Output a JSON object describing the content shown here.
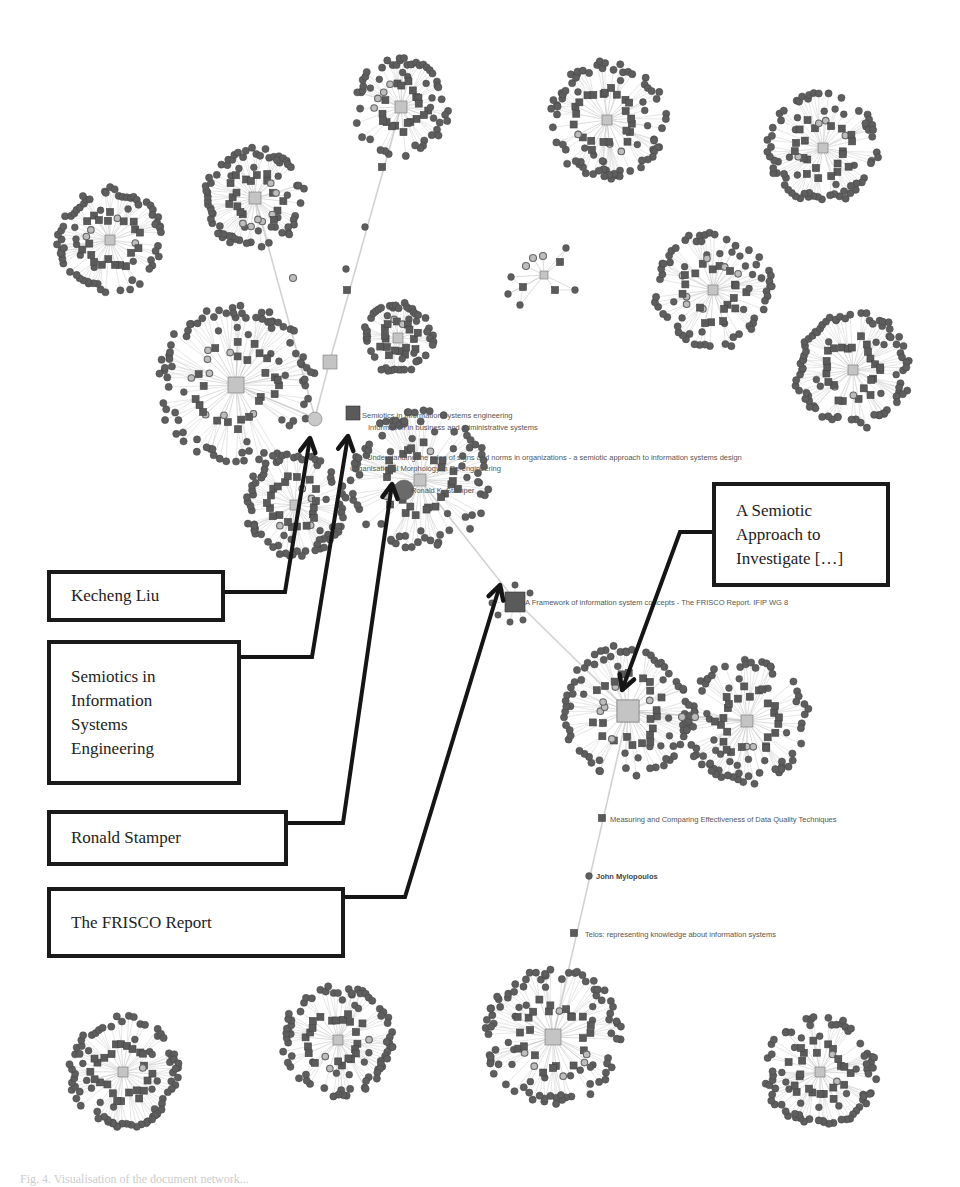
{
  "figure": {
    "type": "network-graph",
    "background": "#ffffff",
    "colors": {
      "document_node": "#5a5a5a",
      "author_node": "#5e5e5e",
      "hub_node": "#c4c4c4",
      "hub_border": "#777777",
      "edge": "#c8c8c8",
      "callout_border": "#1a1a1a",
      "arrow": "#151515"
    }
  },
  "callouts": [
    {
      "id": "kecheng-liu",
      "lines": [
        "Kecheng Liu"
      ],
      "box": [
        47,
        570,
        178,
        52
      ],
      "anchor": [
        225,
        592
      ],
      "path": [
        [
          225,
          592
        ],
        [
          285,
          592
        ],
        [
          310,
          438
        ]
      ]
    },
    {
      "id": "semiotics-ise",
      "lines": [
        "Semiotics in",
        "Information",
        "Systems",
        "Engineering"
      ],
      "box": [
        47,
        640,
        194,
        145
      ],
      "anchor": [
        241,
        657
      ],
      "path": [
        [
          241,
          657
        ],
        [
          312,
          657
        ],
        [
          348,
          436
        ]
      ]
    },
    {
      "id": "ronald-stamper",
      "lines": [
        "Ronald Stamper"
      ],
      "box": [
        47,
        810,
        241,
        56
      ],
      "anchor": [
        288,
        823
      ],
      "path": [
        [
          288,
          823
        ],
        [
          343,
          823
        ],
        [
          392,
          484
        ]
      ]
    },
    {
      "id": "frisco-report",
      "lines": [
        "The FRISCO Report"
      ],
      "box": [
        47,
        887,
        298,
        71
      ],
      "anchor": [
        345,
        897
      ],
      "path": [
        [
          345,
          897
        ],
        [
          405,
          897
        ],
        [
          500,
          585
        ]
      ]
    },
    {
      "id": "semiotic-approach",
      "lines": [
        "A Semiotic",
        "Approach to",
        "Investigate […]"
      ],
      "box": [
        712,
        482,
        178,
        105
      ],
      "anchor": [
        712,
        532
      ],
      "path": [
        [
          712,
          532
        ],
        [
          680,
          532
        ],
        [
          622,
          690
        ]
      ]
    }
  ],
  "node_labels": [
    {
      "text": "Semiotics in information systems engineering",
      "x": 362,
      "y": 418,
      "bold": false
    },
    {
      "text": "Information in business and administrative systems",
      "x": 368,
      "y": 430,
      "bold": false
    },
    {
      "text": "Understanding the roles of signs and norms in organizations - a semiotic approach to information systems design",
      "x": 367,
      "y": 460,
      "bold": false
    },
    {
      "text": "Organisational Morphology in Re-engineering",
      "x": 350,
      "y": 471,
      "bold": false
    },
    {
      "text": "Ronald K. Stamper",
      "x": 411,
      "y": 493,
      "bold": false
    },
    {
      "text": "A Framework of information system concepts - The FRISCO Report. IFIP WG 8",
      "x": 525,
      "y": 605,
      "bold": false
    },
    {
      "text": "Measuring and Comparing Effectiveness of Data Quality Techniques",
      "x": 610,
      "y": 822,
      "bold": false
    },
    {
      "text": "John Mylopoulos",
      "x": 596,
      "y": 879,
      "bold": true
    },
    {
      "text": "Telos: representing knowledge about information systems",
      "x": 585,
      "y": 937,
      "bold": false
    }
  ],
  "clusters": [
    {
      "id": "c-topleft",
      "cx": 110,
      "cy": 240,
      "r": 52,
      "hub": 5
    },
    {
      "id": "c-top2",
      "cx": 255,
      "cy": 198,
      "r": 50,
      "hub": 6
    },
    {
      "id": "c-top3",
      "cx": 401,
      "cy": 107,
      "r": 48,
      "hub": 6
    },
    {
      "id": "c-top4",
      "cx": 607,
      "cy": 120,
      "r": 58,
      "hub": 5
    },
    {
      "id": "c-topright",
      "cx": 823,
      "cy": 148,
      "r": 55,
      "hub": 5
    },
    {
      "id": "c-midright1",
      "cx": 713,
      "cy": 290,
      "r": 58,
      "hub": 5
    },
    {
      "id": "c-midright2",
      "cx": 853,
      "cy": 370,
      "r": 58,
      "hub": 5
    },
    {
      "id": "c-left-big",
      "cx": 236,
      "cy": 385,
      "r": 78,
      "hub": 8
    },
    {
      "id": "c-mid-small",
      "cx": 398,
      "cy": 338,
      "r": 35,
      "hub": 5
    },
    {
      "id": "c-stamper",
      "cx": 420,
      "cy": 480,
      "r": 68,
      "hub": 6
    },
    {
      "id": "c-lower-left",
      "cx": 295,
      "cy": 505,
      "r": 50,
      "hub": 5
    },
    {
      "id": "c-semiotic",
      "cx": 628,
      "cy": 711,
      "r": 65,
      "hub": 11
    },
    {
      "id": "c-right-pair",
      "cx": 747,
      "cy": 721,
      "r": 62,
      "hub": 6
    },
    {
      "id": "c-bottom1",
      "cx": 123,
      "cy": 1072,
      "r": 55,
      "hub": 5
    },
    {
      "id": "c-bottom2",
      "cx": 338,
      "cy": 1040,
      "r": 55,
      "hub": 5
    },
    {
      "id": "c-bottom3",
      "cx": 553,
      "cy": 1037,
      "r": 68,
      "hub": 8
    },
    {
      "id": "c-bottom4",
      "cx": 820,
      "cy": 1072,
      "r": 55,
      "hub": 5
    }
  ],
  "small_graph": {
    "hub": [
      544,
      275
    ],
    "nodes": [
      [
        523,
        287,
        "sq"
      ],
      [
        511,
        277,
        "c"
      ],
      [
        508,
        294,
        "c"
      ],
      [
        520,
        305,
        "c"
      ],
      [
        555,
        290,
        "sq"
      ],
      [
        575,
        290,
        "c"
      ],
      [
        560,
        262,
        "sq"
      ],
      [
        566,
        248,
        "c"
      ],
      [
        526,
        266,
        "ring"
      ],
      [
        533,
        258,
        "ring"
      ],
      [
        543,
        256,
        "ring"
      ]
    ]
  },
  "bridges": [
    {
      "from": [
        255,
        198
      ],
      "to": [
        315,
        418
      ],
      "mid": [
        [
          293,
          278,
          "ring"
        ]
      ]
    },
    {
      "from": [
        401,
        107
      ],
      "to": [
        330,
        360
      ],
      "mid": [
        [
          382,
          167,
          "sq"
        ],
        [
          365,
          227,
          "c"
        ],
        [
          347,
          290,
          "sq"
        ],
        [
          346,
          269,
          "c"
        ]
      ]
    },
    {
      "from": [
        236,
        385
      ],
      "to": [
        315,
        418
      ],
      "mid": []
    },
    {
      "from": [
        330,
        360
      ],
      "to": [
        315,
        418
      ],
      "mid": []
    },
    {
      "from": [
        420,
        480
      ],
      "to": [
        515,
        600
      ],
      "mid": []
    },
    {
      "from": [
        515,
        600
      ],
      "to": [
        628,
        711
      ],
      "mid": []
    },
    {
      "from": [
        628,
        711
      ],
      "to": [
        747,
        721
      ],
      "mid": [
        [
          682,
          717,
          "ring"
        ],
        [
          695,
          717,
          "ring"
        ]
      ]
    },
    {
      "from": [
        628,
        711
      ],
      "to": [
        553,
        1037
      ],
      "mid": [
        [
          602,
          818,
          "sq"
        ],
        [
          589,
          876,
          "c"
        ],
        [
          574,
          933,
          "sq"
        ]
      ]
    }
  ],
  "special_nodes": [
    {
      "id": "kecheng-liu-node",
      "x": 315,
      "y": 419,
      "shape": "circle-hub",
      "size": 7
    },
    {
      "id": "semiotics-ise-node",
      "x": 353,
      "y": 413,
      "shape": "square",
      "size": 7
    },
    {
      "id": "mid-hub",
      "x": 330,
      "y": 362,
      "shape": "square-hub",
      "size": 7
    },
    {
      "id": "stamper-node",
      "x": 404,
      "y": 490,
      "shape": "circle",
      "size": 10
    },
    {
      "id": "frisco-node",
      "x": 515,
      "y": 602,
      "shape": "square",
      "size": 10
    },
    {
      "id": "semiotic-approach-node",
      "x": 628,
      "y": 711,
      "shape": "square-hub",
      "size": 11
    }
  ],
  "caption": "Fig. 4. Visualisation of the document network..."
}
